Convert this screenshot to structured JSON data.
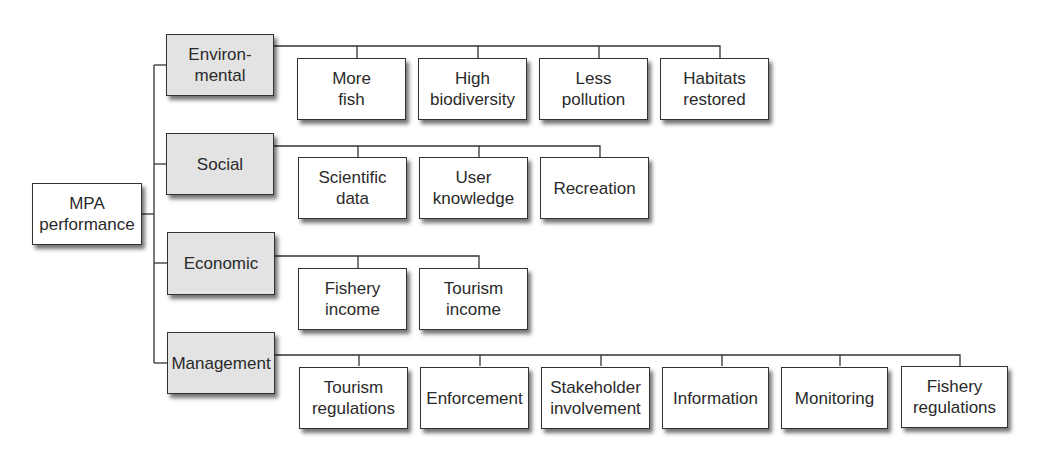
{
  "diagram": {
    "type": "hierarchy-tree",
    "root": {
      "label": "MPA\nperformance"
    },
    "categories": [
      {
        "label": "Environ-\nmental",
        "children": [
          "More\nfish",
          "High\nbiodiversity",
          "Less\npollution",
          "Habitats\nrestored"
        ]
      },
      {
        "label": "Social",
        "children": [
          "Scientific\ndata",
          "User\nknowledge",
          "Recreation"
        ]
      },
      {
        "label": "Economic",
        "children": [
          "Fishery\nincome",
          "Tourism\nincome"
        ]
      },
      {
        "label": "Management",
        "children": [
          "Tourism\nregulations",
          "Enforcement",
          "Stakeholder\ninvolvement",
          "Information",
          "Monitoring",
          "Fishery\nregulations"
        ]
      }
    ],
    "colors": {
      "category_fill": "#e3e3e3",
      "leaf_fill": "#ffffff",
      "line": "#333333"
    }
  }
}
